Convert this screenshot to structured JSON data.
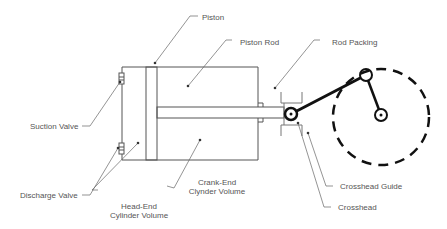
{
  "diagram": {
    "labels": {
      "piston": "Piston",
      "piston_rod": "Piston Rod",
      "rod_packing": "Rod Packing",
      "suction_valve": "Suction Valve",
      "discharge_valve": "Discharge Valve",
      "head_end_line1": "Head-End",
      "head_end_line2": "Cylinder Volume",
      "crank_end_line1": "Crank-End",
      "crank_end_line2": "Clynder Volume",
      "crosshead_guide": "Crosshead Guide",
      "crosshead": "Crosshead"
    },
    "colors": {
      "line": "#555555",
      "heavy": "#111111",
      "text": "#555555"
    }
  }
}
